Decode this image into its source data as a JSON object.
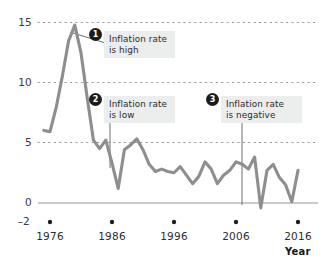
{
  "chart_data": {
    "type": "line",
    "title": "",
    "xlabel": "Year",
    "ylabel": "",
    "xlim": [
      1974,
      2017
    ],
    "ylim": [
      -2,
      15
    ],
    "grid": "horizontal-dotted",
    "legend": "none",
    "line_color": "#8e8e8e",
    "zero_line_color": "#b5b5b5",
    "ytick_labels": [
      "15",
      "10",
      "5",
      "0",
      "–2"
    ],
    "ytick_values": [
      15,
      10,
      5,
      0,
      -2
    ],
    "xtick_labels": [
      "1976",
      "1986",
      "1996",
      "2006",
      "2016"
    ],
    "xtick_values": [
      1976,
      1986,
      1996,
      2006,
      2016
    ],
    "series_name": "Inflation rate",
    "x": [
      1975,
      1976,
      1977,
      1978,
      1979,
      1980,
      1981,
      1982,
      1983,
      1984,
      1985,
      1986,
      1987,
      1988,
      1989,
      1990,
      1991,
      1992,
      1993,
      1994,
      1995,
      1996,
      1997,
      1998,
      1999,
      2000,
      2001,
      2002,
      2003,
      2004,
      2005,
      2006,
      2007,
      2008,
      2009,
      2010,
      2011,
      2012,
      2013,
      2014,
      2015,
      2016
    ],
    "values": [
      6.0,
      5.9,
      7.9,
      10.5,
      13.4,
      14.7,
      12.4,
      8.7,
      5.2,
      4.5,
      5.2,
      3.3,
      1.2,
      4.4,
      4.8,
      5.3,
      4.4,
      3.2,
      2.6,
      2.8,
      2.6,
      2.5,
      3.0,
      2.3,
      1.6,
      2.2,
      3.4,
      2.8,
      1.6,
      2.3,
      2.7,
      3.4,
      3.2,
      2.8,
      3.8,
      -0.4,
      2.7,
      3.2,
      2.1,
      1.5,
      0.1,
      2.7
    ],
    "annotations": [
      {
        "id": "1",
        "text": "Inflation rate\nis high",
        "badge": "❶",
        "number": "1"
      },
      {
        "id": "2",
        "text": "Inflation rate\nis low",
        "badge": "❷",
        "number": "2"
      },
      {
        "id": "3",
        "text": "Inflation rate\nis negative",
        "badge": "❸",
        "number": "3"
      }
    ]
  },
  "axis": {
    "x_title": "Year"
  }
}
